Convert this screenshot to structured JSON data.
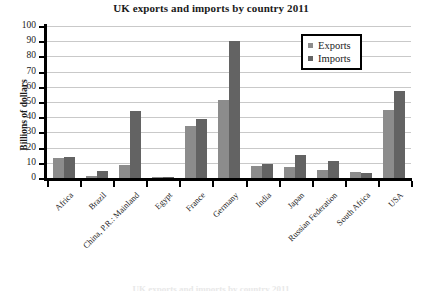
{
  "chart_data": {
    "type": "bar",
    "title": "UK exports and imports by country 2011",
    "xlabel": "",
    "ylabel": "Billions of dollars",
    "ylim": [
      0,
      100
    ],
    "yticks": [
      0,
      10,
      20,
      30,
      40,
      50,
      60,
      70,
      80,
      90,
      100
    ],
    "grid": true,
    "legend_position": "top-right",
    "categories": [
      "Africa",
      "Brazil",
      "China, P.R.: Mainland",
      "Egypt",
      "France",
      "Germany",
      "India",
      "Japan",
      "Russian Federation",
      "South Africa",
      "USA"
    ],
    "series": [
      {
        "name": "Exports",
        "color": "#8c8c8c",
        "values": [
          13,
          1.5,
          8.5,
          0.5,
          34,
          51,
          8,
          7,
          5,
          4,
          45
        ]
      },
      {
        "name": "Imports",
        "color": "#636363",
        "values": [
          13.5,
          4.5,
          44,
          0.5,
          39,
          90,
          9,
          15,
          11,
          3,
          57
        ]
      }
    ]
  },
  "bottom_caption": "UK exports and imports by country 2011"
}
